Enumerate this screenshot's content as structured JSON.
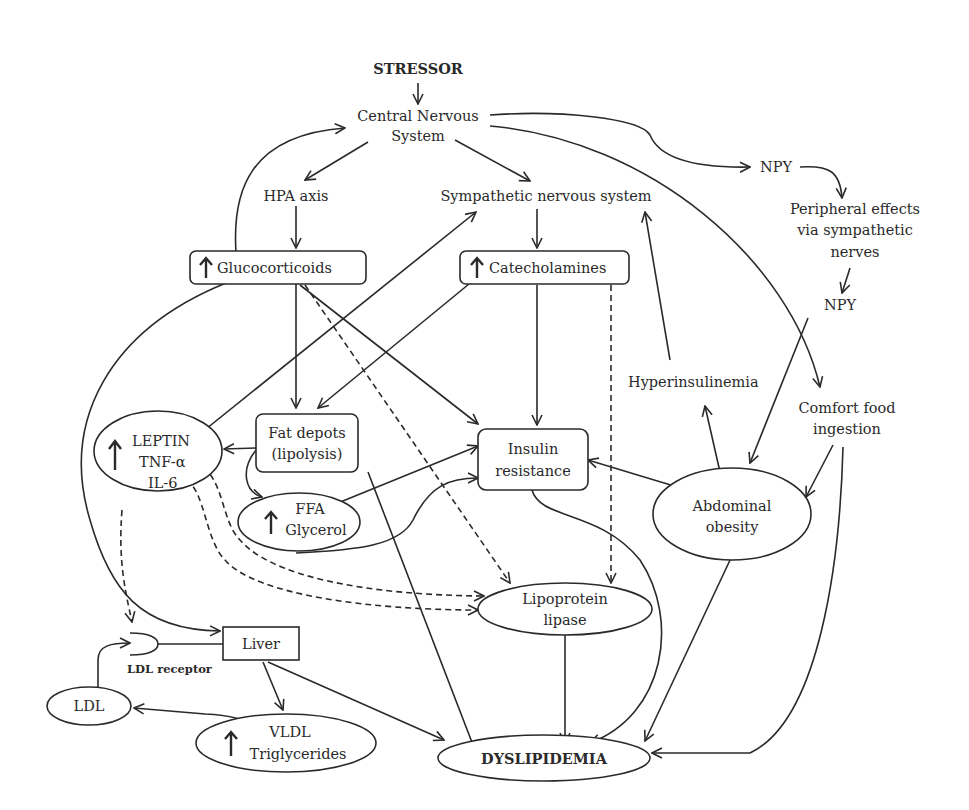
{
  "diagram": {
    "nodes": {
      "stressor": "STRESSOR",
      "cns_line1": "Central Nervous",
      "cns_line2": "System",
      "hpa": "HPA axis",
      "sns": "Sympathetic nervous system",
      "npy_top": "NPY",
      "peripheral_line1": "Peripheral effects",
      "peripheral_line2": "via sympathetic",
      "peripheral_line3": "nerves",
      "npy_lower": "NPY",
      "glucocorticoids": "Glucocorticoids",
      "catecholamines": "Catecholamines",
      "hyperinsulinemia": "Hyperinsulinemia",
      "comfort_line1": "Comfort food",
      "comfort_line2": "ingestion",
      "leptin": "LEPTIN",
      "tnf": "TNF-α",
      "il6": "IL-6",
      "fat_line1": "Fat depots",
      "fat_line2": "(lipolysis)",
      "ffa": "FFA",
      "glycerol": "Glycerol",
      "insulin_line1": "Insulin",
      "insulin_line2": "resistance",
      "abdominal_line1": "Abdominal",
      "abdominal_line2": "obesity",
      "lpl_line1": "Lipoprotein",
      "lpl_line2": "lipase",
      "liver": "Liver",
      "ldl_receptor": "LDL receptor",
      "ldl": "LDL",
      "vldl": "VLDL",
      "triglycerides": "Triglycerides",
      "dyslipidemia": "DYSLIPIDEMIA"
    },
    "edges": [
      {
        "from": "STRESSOR",
        "to": "Central Nervous System",
        "style": "solid"
      },
      {
        "from": "Central Nervous System",
        "to": "HPA axis",
        "style": "solid"
      },
      {
        "from": "Central Nervous System",
        "to": "Sympathetic nervous system",
        "style": "solid"
      },
      {
        "from": "Central Nervous System",
        "to": "NPY",
        "style": "solid"
      },
      {
        "from": "Central Nervous System",
        "to": "Comfort food ingestion",
        "style": "solid"
      },
      {
        "from": "NPY",
        "to": "Peripheral effects via sympathetic nerves",
        "style": "solid"
      },
      {
        "from": "Peripheral effects via sympathetic nerves",
        "to": "NPY (lower)",
        "style": "solid"
      },
      {
        "from": "NPY (lower)",
        "to": "Abdominal obesity",
        "style": "solid"
      },
      {
        "from": "HPA axis",
        "to": "Glucocorticoids",
        "style": "solid"
      },
      {
        "from": "Glucocorticoids",
        "to": "Central Nervous System",
        "style": "solid"
      },
      {
        "from": "Glucocorticoids",
        "to": "Fat depots (lipolysis)",
        "style": "solid"
      },
      {
        "from": "Glucocorticoids",
        "to": "Insulin resistance",
        "style": "solid"
      },
      {
        "from": "Glucocorticoids",
        "to": "Lipoprotein lipase",
        "style": "dashed"
      },
      {
        "from": "Glucocorticoids",
        "to": "Liver",
        "style": "solid"
      },
      {
        "from": "Sympathetic nervous system",
        "to": "Catecholamines",
        "style": "solid"
      },
      {
        "from": "Catecholamines",
        "to": "Fat depots (lipolysis)",
        "style": "solid"
      },
      {
        "from": "Catecholamines",
        "to": "Insulin resistance",
        "style": "solid"
      },
      {
        "from": "Catecholamines",
        "to": "Lipoprotein lipase",
        "style": "dashed"
      },
      {
        "from": "LEPTIN",
        "to": "Sympathetic nervous system",
        "style": "solid"
      },
      {
        "from": "Fat depots (lipolysis)",
        "to": "LEPTIN / TNF-α / IL-6",
        "style": "solid"
      },
      {
        "from": "Fat depots (lipolysis)",
        "to": "FFA / Glycerol",
        "style": "solid"
      },
      {
        "from": "Fat depots (lipolysis)",
        "to": "DYSLIPIDEMIA",
        "style": "solid"
      },
      {
        "from": "FFA",
        "to": "Insulin resistance",
        "style": "solid"
      },
      {
        "from": "Glycerol",
        "to": "Insulin resistance",
        "style": "solid"
      },
      {
        "from": "TNF-α",
        "to": "Lipoprotein lipase",
        "style": "dashed"
      },
      {
        "from": "IL-6",
        "to": "Lipoprotein lipase",
        "style": "dashed"
      },
      {
        "from": "TNF-α / IL-6",
        "to": "LDL receptor",
        "style": "dashed"
      },
      {
        "from": "Abdominal obesity",
        "to": "Insulin resistance",
        "style": "solid"
      },
      {
        "from": "Abdominal obesity",
        "to": "Hyperinsulinemia",
        "style": "solid"
      },
      {
        "from": "Abdominal obesity",
        "to": "DYSLIPIDEMIA",
        "style": "solid"
      },
      {
        "from": "Hyperinsulinemia",
        "to": "Sympathetic nervous system",
        "style": "solid"
      },
      {
        "from": "Comfort food ingestion",
        "to": "Abdominal obesity",
        "style": "solid"
      },
      {
        "from": "Comfort food ingestion",
        "to": "DYSLIPIDEMIA",
        "style": "solid"
      },
      {
        "from": "Insulin resistance",
        "to": "DYSLIPIDEMIA",
        "style": "solid"
      },
      {
        "from": "Lipoprotein lipase",
        "to": "DYSLIPIDEMIA",
        "style": "solid"
      },
      {
        "from": "Liver",
        "to": "VLDL / Triglycerides",
        "style": "solid"
      },
      {
        "from": "Liver",
        "to": "DYSLIPIDEMIA",
        "style": "solid"
      },
      {
        "from": "Liver",
        "to": "LDL receptor",
        "style": "solid"
      },
      {
        "from": "VLDL",
        "to": "LDL",
        "style": "solid"
      },
      {
        "from": "LDL",
        "to": "LDL receptor",
        "style": "solid"
      }
    ]
  }
}
